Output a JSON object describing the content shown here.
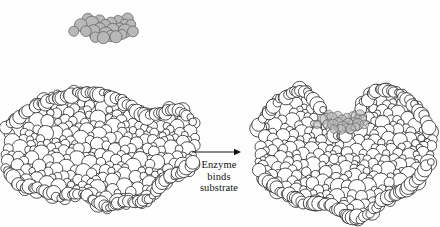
{
  "figure": {
    "type": "diagram",
    "topic": "enzyme-substrate-binding",
    "background_color": "#fefefe",
    "outline_color": "#1a1a1a",
    "sphere_fill_color": "#ffffff",
    "substrate_fill_color": "#b8b8b8",
    "substrate_outline_color": "#5a5a5a"
  },
  "reaction": {
    "label_line1": "Enzyme",
    "label_line2": "binds",
    "label_line3": "substrate",
    "arrow_icon": "right-arrow-icon",
    "arrow": {
      "x1": 192,
      "y1": 152,
      "x2": 241,
      "y2": 152
    },
    "label_box": {
      "left": 188,
      "top": 159,
      "width": 62
    }
  },
  "panels": [
    {
      "id": "free-enzyme-panel",
      "name": "Free enzyme with unbound substrate",
      "enzyme_label": "enzyme-free",
      "substrate_label": "substrate-unbound",
      "substrate_bound": false
    },
    {
      "id": "enzyme-substrate-complex-panel",
      "name": "Enzyme-substrate complex",
      "enzyme_label": "enzyme-bound",
      "substrate_label": "substrate-bound",
      "substrate_bound": true
    }
  ],
  "chart_data": {
    "type": "diagram",
    "title": "Enzyme binds substrate",
    "annotations": [
      "Enzyme",
      "binds",
      "substrate"
    ],
    "elements": [
      {
        "name": "substrate-unbound",
        "shape": "space-filling-model",
        "fill": "gray",
        "cx": 105,
        "cy": 28,
        "rx": 35,
        "ry": 17
      },
      {
        "name": "enzyme-free",
        "shape": "space-filling-model",
        "fill": "white",
        "cx": 100,
        "cy": 148,
        "rx": 96,
        "ry": 68
      },
      {
        "name": "reaction-arrow",
        "shape": "arrow",
        "x1": 192,
        "y1": 152,
        "x2": 241,
        "y2": 152
      },
      {
        "name": "enzyme-bound",
        "shape": "space-filling-model",
        "fill": "white",
        "cx": 343,
        "cy": 146,
        "rx": 90,
        "ry": 80
      },
      {
        "name": "substrate-bound",
        "shape": "space-filling-model",
        "fill": "gray",
        "cx": 342,
        "cy": 122,
        "rx": 27,
        "ry": 17
      }
    ]
  }
}
